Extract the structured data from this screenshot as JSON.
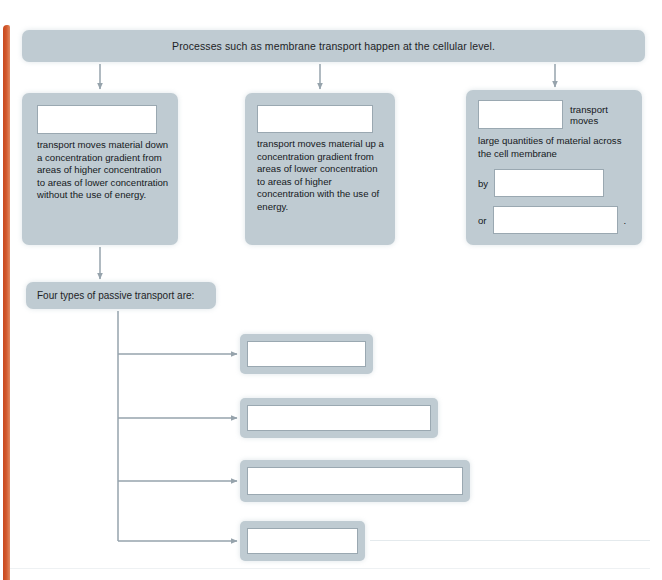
{
  "page": {
    "accent_stripe_color": "#c9491f",
    "panel_color": "#bfcbd2",
    "blank_border_color": "#9aa8b1",
    "text_color": "#15191c"
  },
  "banner": {
    "text": "Processes such as membrane transport happen at the cellular level."
  },
  "panels": {
    "passive": {
      "blank_value": "",
      "blank_placeholder": "",
      "body": "transport moves material down a concentration gradient from areas of higher concentration to areas of lower concentration without the use of energy."
    },
    "active": {
      "blank_value": "",
      "blank_placeholder": "",
      "body": "transport moves material up a concentration gradient from areas of lower concentration to areas of higher concentration with the use of energy."
    },
    "bulk": {
      "blank_value": "",
      "blank_placeholder": "",
      "lead_text": "transport moves",
      "body": "large quantities of material across the cell membrane",
      "by_label": "by",
      "by_blank_value": "",
      "or_label": "or",
      "or_blank_value": "",
      "period": "."
    }
  },
  "four_types": {
    "heading": "Four types of passive transport are:",
    "answers": [
      {
        "index": "1",
        "value": "",
        "placeholder": ""
      },
      {
        "index": "2",
        "value": "",
        "placeholder": ""
      },
      {
        "index": "3",
        "value": "",
        "placeholder": ""
      },
      {
        "index": "4",
        "value": "",
        "placeholder": ""
      }
    ]
  }
}
